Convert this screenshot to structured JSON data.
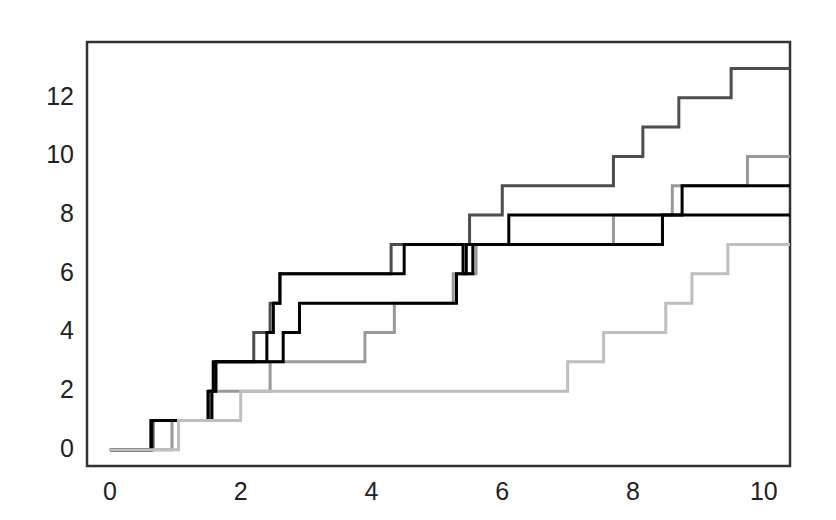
{
  "chart_data": {
    "type": "line",
    "title": "",
    "subtitle": "",
    "xlabel": "",
    "ylabel": "",
    "xlim": [
      -0.35,
      10.4
    ],
    "ylim": [
      -0.55,
      13.9
    ],
    "xticks": [
      0,
      2,
      4,
      6,
      8,
      10
    ],
    "xticklabels": [
      "0",
      "2",
      "4",
      "6",
      "8",
      "10"
    ],
    "yticks": [
      0,
      2,
      4,
      6,
      8,
      10,
      12
    ],
    "yticklabels": [
      "0",
      "2",
      "4",
      "6",
      "8",
      "10",
      "12"
    ],
    "grid": false,
    "legend": false,
    "legend_position": "none",
    "frame": "box",
    "drawstyle": "steps-post",
    "note": "Five counting-process (Poisson) sample paths; each series is a step function starting at (0,0) and jumping by 1 at each event time.",
    "series": [
      {
        "name": "path-1",
        "color": "#4d4d4d",
        "linewidth": 3,
        "final_value": 13,
        "x": [
          0.0,
          0.66,
          1.52,
          1.58,
          1.62,
          2.05,
          2.2,
          2.45,
          2.55,
          4.3,
          5.5,
          6.0,
          7.7,
          8.15,
          8.45,
          8.75,
          9.2,
          9.55,
          10.0
        ],
        "y": [
          0,
          1,
          2,
          3,
          4,
          5,
          6,
          7,
          8,
          9,
          10,
          11,
          12,
          13,
          13,
          13,
          13,
          13,
          13
        ],
        "events": [
          0.66,
          1.52,
          1.58,
          1.62,
          2.05,
          2.2,
          2.45,
          2.55,
          4.3,
          5.5,
          6.0,
          7.7,
          8.15
        ],
        "steps": [
          {
            "x": 0.0,
            "y": 0
          },
          {
            "x": 0.66,
            "y": 1
          },
          {
            "x": 1.52,
            "y": 2
          },
          {
            "x": 1.62,
            "y": 3
          },
          {
            "x": 2.2,
            "y": 4
          },
          {
            "x": 2.45,
            "y": 5
          },
          {
            "x": 2.6,
            "y": 6
          },
          {
            "x": 4.3,
            "y": 7
          },
          {
            "x": 5.5,
            "y": 8
          },
          {
            "x": 6.0,
            "y": 9
          },
          {
            "x": 7.7,
            "y": 10
          },
          {
            "x": 8.15,
            "y": 11
          },
          {
            "x": 8.7,
            "y": 12
          },
          {
            "x": 9.5,
            "y": 13
          },
          {
            "x": 10.0,
            "y": 13
          }
        ]
      },
      {
        "name": "path-2",
        "color": "#999999",
        "linewidth": 3,
        "final_value": 10,
        "steps": [
          {
            "x": 0.0,
            "y": 0
          },
          {
            "x": 0.95,
            "y": 1
          },
          {
            "x": 1.55,
            "y": 2
          },
          {
            "x": 2.45,
            "y": 3
          },
          {
            "x": 3.9,
            "y": 4
          },
          {
            "x": 4.35,
            "y": 5
          },
          {
            "x": 5.25,
            "y": 6
          },
          {
            "x": 5.6,
            "y": 7
          },
          {
            "x": 7.7,
            "y": 8
          },
          {
            "x": 8.6,
            "y": 9
          },
          {
            "x": 9.75,
            "y": 10
          },
          {
            "x": 10.0,
            "y": 10
          }
        ]
      },
      {
        "name": "path-3",
        "color": "#000000",
        "linewidth": 3,
        "final_value": 9,
        "steps": [
          {
            "x": 0.0,
            "y": 0
          },
          {
            "x": 0.63,
            "y": 1
          },
          {
            "x": 1.56,
            "y": 2
          },
          {
            "x": 1.62,
            "y": 3
          },
          {
            "x": 2.65,
            "y": 4
          },
          {
            "x": 2.9,
            "y": 5
          },
          {
            "x": 5.3,
            "y": 6
          },
          {
            "x": 5.45,
            "y": 7
          },
          {
            "x": 8.45,
            "y": 8
          },
          {
            "x": 8.75,
            "y": 9
          },
          {
            "x": 10.0,
            "y": 9
          }
        ]
      },
      {
        "name": "path-4",
        "color": "#000000",
        "linewidth": 3,
        "final_value": 8,
        "steps": [
          {
            "x": 0.0,
            "y": 0
          },
          {
            "x": 0.63,
            "y": 1
          },
          {
            "x": 1.5,
            "y": 2
          },
          {
            "x": 1.58,
            "y": 3
          },
          {
            "x": 2.4,
            "y": 4
          },
          {
            "x": 2.5,
            "y": 5
          },
          {
            "x": 2.6,
            "y": 6
          },
          {
            "x": 4.5,
            "y": 7
          },
          {
            "x": 5.4,
            "y": 6
          },
          {
            "x": 5.55,
            "y": 7
          },
          {
            "x": 6.1,
            "y": 8
          },
          {
            "x": 10.0,
            "y": 8
          }
        ]
      },
      {
        "name": "path-5",
        "color": "#bfbfbf",
        "linewidth": 3,
        "final_value": 7,
        "steps": [
          {
            "x": 0.0,
            "y": 0
          },
          {
            "x": 1.05,
            "y": 1
          },
          {
            "x": 2.0,
            "y": 2
          },
          {
            "x": 7.0,
            "y": 3
          },
          {
            "x": 7.55,
            "y": 4
          },
          {
            "x": 8.5,
            "y": 5
          },
          {
            "x": 8.9,
            "y": 6
          },
          {
            "x": 9.45,
            "y": 7
          },
          {
            "x": 10.0,
            "y": 7
          }
        ]
      }
    ],
    "axis_color": "#333333",
    "background": "#ffffff"
  },
  "axes": {
    "y_labels": [
      "0",
      "2",
      "4",
      "6",
      "8",
      "10",
      "12"
    ],
    "x_labels": [
      "0",
      "2",
      "4",
      "6",
      "8",
      "10"
    ]
  }
}
